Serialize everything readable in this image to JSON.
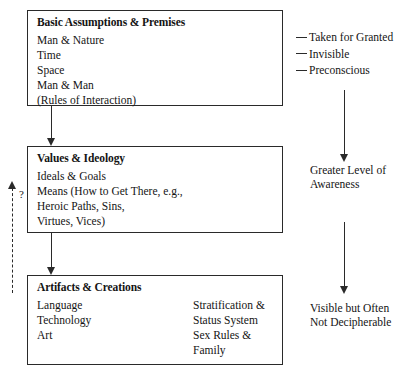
{
  "diagram": {
    "boxes": [
      {
        "id": "assumptions",
        "title": "Basic Assumptions & Premises",
        "body": "Man & Nature\nTime\nSpace\nMan & Man\n(Rules of Interaction)"
      },
      {
        "id": "values",
        "title": "Values & Ideology",
        "body": "Ideals & Goals\nMeans (How to Get There, e.g.,\nHeroic Paths, Sins,\nVirtues, Vices)"
      },
      {
        "id": "artifacts",
        "title": "Artifacts & Creations",
        "column1": "Language\nTechnology\nArt",
        "column2": "Stratification &\nStatus System\nSex Rules &\nFamily"
      }
    ],
    "annotations": {
      "dash_list": [
        "Taken for Granted",
        "Invisible",
        "Preconscious"
      ],
      "awareness": "Greater Level of\nAwareness",
      "decipherable": "Visible but Often\nNot Decipherable",
      "feedback_label": "?"
    },
    "colors": {
      "line": "#2a2a2a",
      "text": "#141414",
      "background": "#ffffff"
    }
  }
}
